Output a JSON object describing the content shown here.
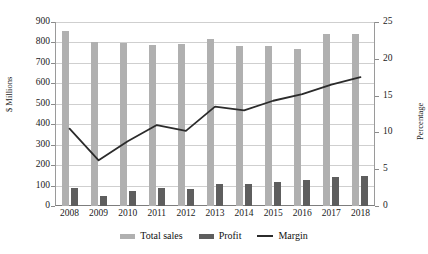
{
  "chart_data": {
    "type": "bar",
    "title": "",
    "subtitle": "",
    "xlabel": "",
    "ylabel": "$ Millions",
    "y2label": "Percentage",
    "categories": [
      "2008",
      "2009",
      "2010",
      "2011",
      "2012",
      "2013",
      "2014",
      "2015",
      "2016",
      "2017",
      "2018"
    ],
    "ylim": [
      0,
      900
    ],
    "y2lim": [
      0,
      25
    ],
    "yticks": [
      0,
      100,
      200,
      300,
      400,
      500,
      600,
      700,
      800,
      900
    ],
    "y2ticks": [
      0,
      5,
      10,
      15,
      20,
      25
    ],
    "grid": true,
    "legend_position": "bottom",
    "series": [
      {
        "name": "Total sales",
        "type": "bar",
        "axis": "left",
        "color": "#b0b0b0",
        "values": [
          855,
          800,
          795,
          790,
          793,
          815,
          785,
          785,
          770,
          840,
          840
        ]
      },
      {
        "name": "Profit",
        "type": "bar",
        "axis": "left",
        "color": "#5e5e5e",
        "values": [
          90,
          50,
          75,
          88,
          83,
          110,
          108,
          118,
          125,
          140,
          148
        ]
      },
      {
        "name": "Margin",
        "type": "line",
        "axis": "right",
        "color": "#2b2b2b",
        "values": [
          10.5,
          6.2,
          8.8,
          11.0,
          10.2,
          13.5,
          13.0,
          14.3,
          15.2,
          16.5,
          17.5
        ]
      }
    ]
  },
  "legend": {
    "items": [
      {
        "label": "Total sales",
        "swatch": "bar",
        "color": "#b0b0b0"
      },
      {
        "label": "Profit",
        "swatch": "bar",
        "color": "#5e5e5e"
      },
      {
        "label": "Margin",
        "swatch": "line",
        "color": "#2b2b2b"
      }
    ]
  }
}
